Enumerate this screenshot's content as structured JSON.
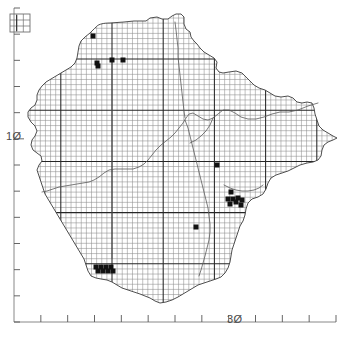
{
  "figure": {
    "title": "",
    "type": "species-distribution-dot-map",
    "background_color": "#ffffff"
  },
  "axes": {
    "y_axis": {
      "name": "left-axis",
      "labels": [
        {
          "text": "1Ø",
          "value": 10,
          "px_y": 136
        }
      ],
      "tick_count": 13,
      "tick_color": "#555555",
      "axis_line_color": "#777777",
      "x_px": 14,
      "top_px": 8,
      "bottom_px": 322
    },
    "x_axis": {
      "name": "bottom-axis",
      "labels": [
        {
          "text": "3Ø",
          "value": 30,
          "px_x": 237
        }
      ],
      "tick_count": 12,
      "tick_color": "#555555",
      "axis_line_color": "#777777",
      "y_px": 322,
      "left_px": 14,
      "right_px": 336
    }
  },
  "inset": {
    "name": "locator-inset-grid",
    "x": 10,
    "y": 14,
    "width": 20,
    "height": 18,
    "cols": 3,
    "rows": 3,
    "border_color": "#6f6f6f"
  },
  "grid": {
    "cell_size_px": 5.12,
    "minor_color": "#8d8d8d",
    "major_color": "#242424",
    "major_every": 10,
    "major_origin_x_px": 112.0,
    "major_origin_y_px": 59.0
  },
  "outline": {
    "name": "county-coastline",
    "stroke_color": "#3c3c3c",
    "stroke_width": 0.9,
    "fill": "none"
  },
  "internal_boundaries": {
    "name": "internal-district-boundaries",
    "stroke_color": "#5a5a5a",
    "stroke_width": 0.8
  },
  "chart_data": {
    "type": "scatter",
    "title": "",
    "xlabel": "",
    "ylabel": "",
    "xlim": [
      26,
      39
    ],
    "ylim": [
      5,
      18
    ],
    "grid": true,
    "legend": null,
    "marker": {
      "shape": "square",
      "color": "#111111",
      "size_px": 5
    },
    "records": [
      {
        "x": 93,
        "y": 36
      },
      {
        "x": 97,
        "y": 63
      },
      {
        "x": 98,
        "y": 66
      },
      {
        "x": 112,
        "y": 60
      },
      {
        "x": 123,
        "y": 60
      },
      {
        "x": 217,
        "y": 165
      },
      {
        "x": 231,
        "y": 192
      },
      {
        "x": 228,
        "y": 199
      },
      {
        "x": 233,
        "y": 199
      },
      {
        "x": 238,
        "y": 198
      },
      {
        "x": 242,
        "y": 200
      },
      {
        "x": 236,
        "y": 202
      },
      {
        "x": 230,
        "y": 204
      },
      {
        "x": 241,
        "y": 205
      },
      {
        "x": 196,
        "y": 227
      },
      {
        "x": 96,
        "y": 267
      },
      {
        "x": 101,
        "y": 267
      },
      {
        "x": 106,
        "y": 267
      },
      {
        "x": 111,
        "y": 267
      },
      {
        "x": 98,
        "y": 271
      },
      {
        "x": 103,
        "y": 271
      },
      {
        "x": 108,
        "y": 271
      },
      {
        "x": 113,
        "y": 271
      }
    ]
  },
  "clip_region": {
    "name": "grid-clip-outline",
    "description": "grid is drawn only inside the mapped landmass outline"
  }
}
